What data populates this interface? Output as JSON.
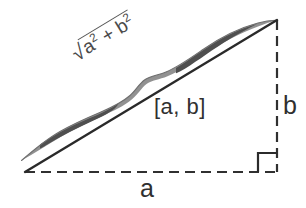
{
  "figure": {
    "background_color": "#ffffff",
    "width": 306,
    "height": 208
  },
  "labels": {
    "base": "a",
    "height": "b",
    "interval": "[a, b]",
    "radical_sign": "√",
    "radical_body_first_base": "a",
    "radical_body_exponent_first": "2",
    "radical_operator": " + ",
    "radical_body_second_base": "b",
    "radical_body_exponent_second": "2"
  },
  "geometry": {
    "vertex_bottom_left": [
      25,
      172
    ],
    "vertex_bottom_right": [
      277,
      172
    ],
    "vertex_top_right": [
      277,
      20
    ],
    "hypotenuse_color": "#2a2a2a",
    "hypotenuse_width": 2.4,
    "dash_color": "#303030",
    "dash_width": 2.2,
    "dash_pattern": "10 6",
    "right_angle_marker_size": 19,
    "curve_color_dark": "#565656",
    "curve_color_light": "#9a9a9a"
  }
}
